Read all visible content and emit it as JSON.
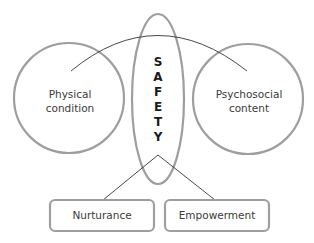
{
  "diagram": {
    "center": {
      "letters": [
        "S",
        "A",
        "F",
        "E",
        "T",
        "Y"
      ],
      "word": "SAFETY"
    },
    "left_circle": {
      "line1": "Physical",
      "line2": "condition"
    },
    "right_circle": {
      "line1": "Psychosocial",
      "line2": "content"
    },
    "boxes": [
      {
        "label": "Nurturance"
      },
      {
        "label": "Empowerment"
      }
    ],
    "colors": {
      "shape_stroke": "#9e9e9e",
      "connector": "#333333",
      "text": "#3a3a3a"
    }
  }
}
